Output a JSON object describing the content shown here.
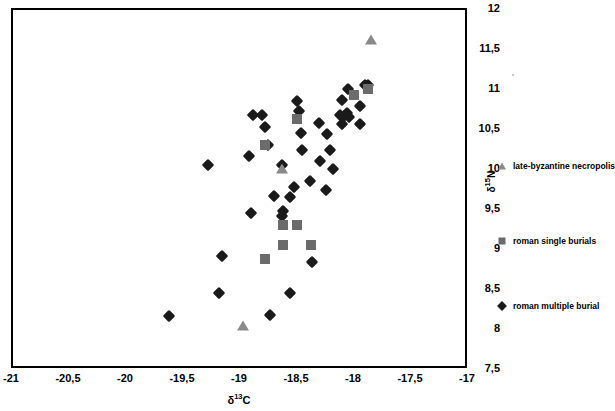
{
  "axes": {
    "x_title_main": "δ",
    "x_title_sup": "13",
    "x_title_tail": "C",
    "y_title_main": "δ",
    "y_title_sup": "15",
    "y_title_tail": "N",
    "x_ticks": [
      "-21",
      "-20,5",
      "-20",
      "-19,5",
      "-19",
      "-18,5",
      "-18",
      "-17,5",
      "-17"
    ],
    "y_ticks": [
      "12",
      "11,5",
      "11",
      "10,5",
      "10",
      "9,5",
      "9",
      "8,5",
      "8",
      "7,5"
    ]
  },
  "legend": {
    "items": [
      {
        "label": "late-byzantine necropolis",
        "marker": "triangle",
        "color": "#8a8a8a"
      },
      {
        "label": "roman single burials",
        "marker": "square",
        "color": "#6b6b6b"
      },
      {
        "label": "roman multiple burial",
        "marker": "diamond",
        "color": "#1a1a1a"
      }
    ]
  },
  "chart_data": {
    "type": "scatter",
    "title": "",
    "xlabel": "δ13C",
    "ylabel": "δ15N",
    "xlim": [
      -21,
      -17
    ],
    "ylim": [
      7.5,
      12
    ],
    "x_ticks": [
      -21,
      -20.5,
      -20,
      -19.5,
      -19,
      -18.5,
      -18,
      -17.5,
      -17
    ],
    "y_ticks": [
      7.5,
      8,
      8.5,
      9,
      9.5,
      10,
      10.5,
      11,
      11.5,
      12
    ],
    "grid": false,
    "legend_position": "right",
    "series": [
      {
        "name": "late-byzantine necropolis",
        "marker": "triangle",
        "color": "#8a8a8a",
        "points": [
          [
            -17.85,
            11.61
          ],
          [
            -18.63,
            10.0
          ],
          [
            -18.97,
            8.03
          ]
        ]
      },
      {
        "name": "roman single burials",
        "marker": "square",
        "color": "#6b6b6b",
        "points": [
          [
            -17.87,
            11.0
          ],
          [
            -18.0,
            10.92
          ],
          [
            -18.5,
            10.62
          ],
          [
            -18.78,
            10.3
          ],
          [
            -18.62,
            9.3
          ],
          [
            -18.5,
            9.3
          ],
          [
            -18.62,
            9.04
          ],
          [
            -18.37,
            9.04
          ],
          [
            -18.78,
            8.87
          ]
        ]
      },
      {
        "name": "roman multiple burial",
        "marker": "diamond",
        "color": "#1a1a1a",
        "points": [
          [
            -17.9,
            11.04
          ],
          [
            -17.87,
            11.04
          ],
          [
            -18.05,
            10.99
          ],
          [
            -18.1,
            10.86
          ],
          [
            -18.5,
            10.84
          ],
          [
            -17.94,
            10.78
          ],
          [
            -18.48,
            10.72
          ],
          [
            -18.88,
            10.67
          ],
          [
            -18.8,
            10.67
          ],
          [
            -18.12,
            10.67
          ],
          [
            -18.08,
            10.66
          ],
          [
            -18.06,
            10.7
          ],
          [
            -18.04,
            10.64
          ],
          [
            -18.3,
            10.57
          ],
          [
            -18.1,
            10.56
          ],
          [
            -17.94,
            10.56
          ],
          [
            -18.78,
            10.52
          ],
          [
            -18.46,
            10.44
          ],
          [
            -18.23,
            10.43
          ],
          [
            -18.75,
            10.3
          ],
          [
            -18.45,
            10.23
          ],
          [
            -18.21,
            10.23
          ],
          [
            -18.92,
            10.16
          ],
          [
            -18.29,
            10.1
          ],
          [
            -19.28,
            10.05
          ],
          [
            -18.63,
            10.05
          ],
          [
            -18.18,
            10.0
          ],
          [
            -18.38,
            9.85
          ],
          [
            -18.52,
            9.77
          ],
          [
            -18.24,
            9.73
          ],
          [
            -18.7,
            9.66
          ],
          [
            -18.56,
            9.64
          ],
          [
            -18.62,
            9.47
          ],
          [
            -18.9,
            9.44
          ],
          [
            -18.63,
            9.41
          ],
          [
            -18.36,
            8.83
          ],
          [
            -19.15,
            8.91
          ],
          [
            -19.18,
            8.44
          ],
          [
            -18.56,
            8.45
          ],
          [
            -18.73,
            8.17
          ],
          [
            -19.62,
            8.16
          ]
        ]
      }
    ]
  }
}
